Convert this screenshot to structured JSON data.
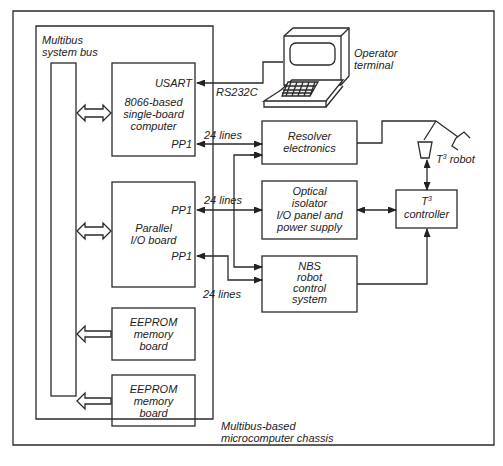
{
  "diagram": {
    "chassis_label_line1": "Multibus-based",
    "chassis_label_line2": "microcomputer chassis",
    "bus_label_line1": "Multibus",
    "bus_label_line2": "system bus",
    "sbc": {
      "usart": "USART",
      "line1": "8066-based",
      "line2": "single-board",
      "line3": "computer",
      "port": "PP1"
    },
    "pio": {
      "port_top": "PP1",
      "line1": "Parallel",
      "line2": "I/O board",
      "port_bottom": "PP1"
    },
    "eeprom1": {
      "line1": "EEPROM",
      "line2": "memory",
      "line3": "board"
    },
    "eeprom2": {
      "line1": "EEPROM",
      "line2": "memory",
      "line3": "board"
    },
    "terminal": {
      "line1": "Operator",
      "line2": "terminal"
    },
    "rs232": "RS232C",
    "lines_label": "24 lines",
    "resolver": {
      "line1": "Resolver",
      "line2": "electronics"
    },
    "optical": {
      "line1": "Optical",
      "line2": "isolator",
      "line3": "I/O panel and",
      "line4": "power supply"
    },
    "nbs": {
      "line1": "NBS",
      "line2": "robot",
      "line3": "control",
      "line4": "system"
    },
    "controller": {
      "prefix": "T",
      "sup": "3",
      "line2": "controller"
    },
    "robot": {
      "prefix": "T",
      "sup": "3",
      "suffix": " robot"
    }
  }
}
